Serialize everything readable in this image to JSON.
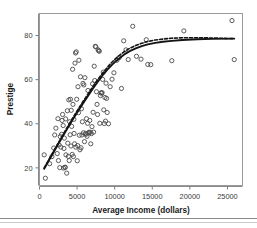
{
  "figure": {
    "background_color": "#ffffff",
    "plot_border_color": "#9a9a9a",
    "axis_color": "#7d7d7d",
    "tick_label_color": "#3a3a3a",
    "axis_title_color": "#1a1a1a",
    "marker_edge_color": "#4a4a4a",
    "curve_color": "#141414",
    "separator_color": "#8a8a8a"
  },
  "chart_data": {
    "type": "scatter",
    "title": "",
    "subtitle": "",
    "xlabel": "Average Income (dollars)",
    "ylabel": "Prestige",
    "xlim": [
      0,
      27000
    ],
    "ylim": [
      12,
      90
    ],
    "xticks": [
      0,
      5000,
      10000,
      15000,
      20000,
      25000
    ],
    "xticklabels": [
      "0",
      "5000",
      "10000",
      "15000",
      "20000",
      "25000"
    ],
    "yticks": [
      20,
      40,
      60,
      80
    ],
    "yticklabels": [
      "20",
      "40",
      "60",
      "80"
    ],
    "grid": false,
    "legend": null,
    "marker": {
      "shape": "open-circle",
      "radius": 2.1,
      "fill": "none",
      "stroke_width": 0.9
    },
    "points": [
      [
        620,
        25.9
      ],
      [
        780,
        15.3
      ],
      [
        1350,
        21.9
      ],
      [
        1656,
        25.1
      ],
      [
        1890,
        29.0
      ],
      [
        2020,
        34.9
      ],
      [
        2180,
        38.0
      ],
      [
        2350,
        26.5
      ],
      [
        2450,
        42.3
      ],
      [
        2520,
        23.3
      ],
      [
        2610,
        30.4
      ],
      [
        2700,
        20.1
      ],
      [
        2760,
        34.2
      ],
      [
        2840,
        29.4
      ],
      [
        2930,
        35.2
      ],
      [
        3000,
        41.5
      ],
      [
        3070,
        44.2
      ],
      [
        3150,
        39.2
      ],
      [
        3190,
        19.9
      ],
      [
        3250,
        28.8
      ],
      [
        3300,
        33.5
      ],
      [
        3390,
        20.2
      ],
      [
        3420,
        20.3
      ],
      [
        3480,
        42.2
      ],
      [
        3520,
        25.9
      ],
      [
        3620,
        17.6
      ],
      [
        3700,
        45.9
      ],
      [
        3760,
        31.2
      ],
      [
        3840,
        25.2
      ],
      [
        3900,
        50.8
      ],
      [
        3950,
        23.3
      ],
      [
        4010,
        40.9
      ],
      [
        4080,
        35.0
      ],
      [
        4120,
        51.1
      ],
      [
        4180,
        29.9
      ],
      [
        4220,
        46.1
      ],
      [
        4280,
        38.8
      ],
      [
        4350,
        26.1
      ],
      [
        4400,
        64.7
      ],
      [
        4450,
        48.8
      ],
      [
        4510,
        25.1
      ],
      [
        4570,
        42.0
      ],
      [
        4600,
        35.6
      ],
      [
        4670,
        30.9
      ],
      [
        4720,
        67.5
      ],
      [
        4790,
        72.1
      ],
      [
        4830,
        29.4
      ],
      [
        4890,
        72.6
      ],
      [
        4950,
        51.1
      ],
      [
        5020,
        23.2
      ],
      [
        5080,
        30.1
      ],
      [
        5120,
        56.8
      ],
      [
        5180,
        45.0
      ],
      [
        5240,
        68.8
      ],
      [
        5300,
        34.8
      ],
      [
        5380,
        28.2
      ],
      [
        5450,
        61.3
      ],
      [
        5520,
        29.1
      ],
      [
        5580,
        46.8
      ],
      [
        5640,
        34.9
      ],
      [
        5700,
        40.9
      ],
      [
        5780,
        58.3
      ],
      [
        5840,
        35.9
      ],
      [
        5900,
        57.6
      ],
      [
        5980,
        31.9
      ],
      [
        6040,
        60.9
      ],
      [
        6120,
        35.6
      ],
      [
        6180,
        35.2
      ],
      [
        6250,
        42.3
      ],
      [
        6320,
        34.3
      ],
      [
        6390,
        40.2
      ],
      [
        6450,
        55.1
      ],
      [
        6530,
        35.9
      ],
      [
        6610,
        36.2
      ],
      [
        6690,
        41.5
      ],
      [
        6750,
        36.1
      ],
      [
        6820,
        30.9
      ],
      [
        6900,
        35.5
      ],
      [
        6980,
        38.7
      ],
      [
        7060,
        58.1
      ],
      [
        7130,
        45.2
      ],
      [
        7200,
        36.2
      ],
      [
        7280,
        66.1
      ],
      [
        7350,
        59.6
      ],
      [
        7420,
        75.1
      ],
      [
        7500,
        74.9
      ],
      [
        7580,
        54.5
      ],
      [
        7650,
        48.8
      ],
      [
        7720,
        44.2
      ],
      [
        7800,
        73.5
      ],
      [
        7880,
        73.1
      ],
      [
        7950,
        72.9
      ],
      [
        8020,
        40.2
      ],
      [
        8100,
        52.8
      ],
      [
        8180,
        54.0
      ],
      [
        8250,
        53.9
      ],
      [
        8330,
        54.1
      ],
      [
        8400,
        60.1
      ],
      [
        8480,
        63.4
      ],
      [
        8550,
        46.3
      ],
      [
        8620,
        40.1
      ],
      [
        8700,
        51.9
      ],
      [
        8780,
        41.2
      ],
      [
        8850,
        58.4
      ],
      [
        8920,
        51.5
      ],
      [
        9000,
        45.1
      ],
      [
        9180,
        40.0
      ],
      [
        9400,
        56.8
      ],
      [
        9650,
        60.2
      ],
      [
        9900,
        63.1
      ],
      [
        10300,
        68.8
      ],
      [
        10600,
        70.0
      ],
      [
        10900,
        56.0
      ],
      [
        11200,
        77.6
      ],
      [
        11500,
        73.5
      ],
      [
        11800,
        69.1
      ],
      [
        12400,
        84.2
      ],
      [
        12900,
        70.6
      ],
      [
        13500,
        69.3
      ],
      [
        14200,
        78.1
      ],
      [
        14400,
        66.9
      ],
      [
        14800,
        66.8
      ],
      [
        17600,
        68.6
      ],
      [
        19200,
        82.1
      ],
      [
        25600,
        86.8
      ],
      [
        25900,
        69.1
      ]
    ],
    "curves": [
      {
        "name": "solid-fit",
        "style": "solid",
        "stroke_width": 1.9,
        "color": "#141414",
        "points": [
          [
            620,
            19.6
          ],
          [
            1200,
            23.1
          ],
          [
            1800,
            26.6
          ],
          [
            2400,
            30.2
          ],
          [
            3000,
            33.8
          ],
          [
            3600,
            37.3
          ],
          [
            4200,
            40.7
          ],
          [
            4800,
            44.0
          ],
          [
            5400,
            47.2
          ],
          [
            6000,
            50.3
          ],
          [
            6600,
            53.4
          ],
          [
            7200,
            56.4
          ],
          [
            7800,
            59.3
          ],
          [
            8400,
            62.0
          ],
          [
            9000,
            64.4
          ],
          [
            9600,
            66.6
          ],
          [
            10200,
            68.5
          ],
          [
            10800,
            70.2
          ],
          [
            11400,
            71.7
          ],
          [
            12000,
            72.9
          ],
          [
            12800,
            74.2
          ],
          [
            13600,
            75.2
          ],
          [
            14400,
            76.0
          ],
          [
            15400,
            76.7
          ],
          [
            16400,
            77.2
          ],
          [
            17600,
            77.6
          ],
          [
            19000,
            78.0
          ],
          [
            21000,
            78.3
          ],
          [
            23000,
            78.5
          ],
          [
            25900,
            78.6
          ]
        ]
      },
      {
        "name": "dashed-fit",
        "style": "dashed",
        "stroke_width": 1.6,
        "color": "#141414",
        "dash_pattern": "3,2",
        "points": [
          [
            620,
            19.9
          ],
          [
            1200,
            23.5
          ],
          [
            1800,
            27.1
          ],
          [
            2400,
            30.7
          ],
          [
            3000,
            34.3
          ],
          [
            3600,
            37.9
          ],
          [
            4200,
            41.3
          ],
          [
            4800,
            44.7
          ],
          [
            5400,
            48.0
          ],
          [
            6000,
            51.2
          ],
          [
            6600,
            54.3
          ],
          [
            7200,
            57.4
          ],
          [
            7800,
            60.3
          ],
          [
            8400,
            63.0
          ],
          [
            9000,
            65.5
          ],
          [
            9600,
            67.8
          ],
          [
            10200,
            69.8
          ],
          [
            10800,
            71.5
          ],
          [
            11400,
            73.0
          ],
          [
            12000,
            74.2
          ],
          [
            12800,
            75.5
          ],
          [
            13600,
            76.5
          ],
          [
            14400,
            77.3
          ],
          [
            15400,
            78.0
          ],
          [
            16400,
            78.4
          ],
          [
            17600,
            78.8
          ],
          [
            19000,
            79.0
          ],
          [
            21000,
            79.0
          ],
          [
            23000,
            78.9
          ],
          [
            25900,
            78.6
          ]
        ]
      }
    ]
  }
}
